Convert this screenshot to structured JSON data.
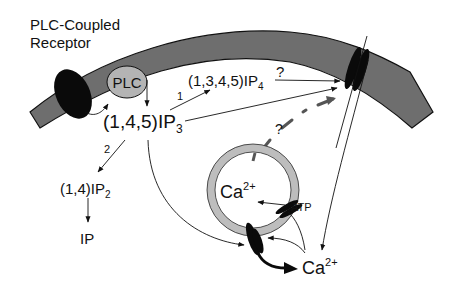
{
  "title": "PLC-Coupled Receptor",
  "labels": {
    "receptor_line1": "PLC-Coupled",
    "receptor_line2": "Receptor",
    "plc": "PLC",
    "ip3_main": "(1,4,5)IP",
    "ip3_sub": "3",
    "ip4_main": "(1,3,4,5)IP",
    "ip4_sub": "4",
    "ip4_question": "?",
    "ip2_main": "(1,4)IP",
    "ip2_sub": "2",
    "ip": "IP",
    "path1": "1",
    "path2": "2",
    "store_question": "?",
    "store_ca_main": "Ca",
    "store_ca_sup": "2+",
    "atp": "ATP",
    "cyto_ca_main": "Ca",
    "cyto_ca_sup": "2+"
  },
  "colors": {
    "membrane": "#6e6e6e",
    "membrane_edge": "#111111",
    "plc_fill": "#b4b4b4",
    "store_ring": "#bdbdbd",
    "dark": "#0a0a0a",
    "dashed": "#555555"
  }
}
